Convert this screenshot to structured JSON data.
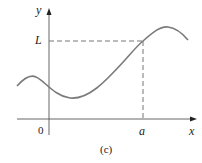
{
  "figure": {
    "caption": "(c)",
    "axis_labels": {
      "x": "x",
      "y": "y"
    },
    "tick_labels": {
      "origin": "0",
      "a": "a",
      "L": "L"
    },
    "colors": {
      "curve": "#7a7a7a",
      "axes": "#444444",
      "dashes": "#777777",
      "text": "#222222"
    }
  }
}
